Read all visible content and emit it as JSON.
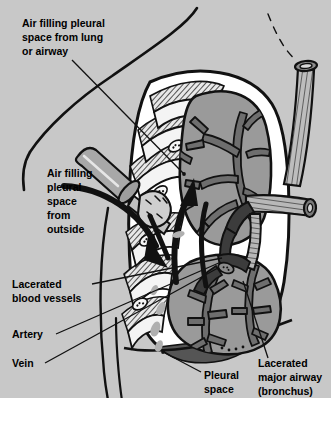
{
  "figure": {
    "background_color": "#ffffff",
    "panel_color": "#c8c8c8",
    "ink_color": "#000000"
  },
  "colors": {
    "body_fill": "#c8c8c8",
    "pleural_air": "#ffffff",
    "lung_fill": "#9a9a9a",
    "lung_dark": "#6e6e6e",
    "airway_fill": "#b4b4b4",
    "blood_dark": "#3c3c3c",
    "rib_fill": "#f2f2f2",
    "muscle_hatch": "#000000",
    "effusion_fill": "#555555",
    "knife_metal": "#a8a8a8"
  },
  "labels": [
    {
      "id": "air-from-lung",
      "name": "label-air-filling-from-lung",
      "lines": [
        "Air filling pleural",
        "space from lung",
        "or airway"
      ],
      "x": 22,
      "y": 27,
      "anchor": "start",
      "leader": {
        "x1": 72,
        "y1": 60,
        "x2": 184,
        "y2": 174
      }
    },
    {
      "id": "air-from-outside",
      "name": "label-air-filling-from-outside",
      "lines": [
        "Air filling",
        "pleural",
        "space",
        "from",
        "outside"
      ],
      "x": 47,
      "y": 177,
      "anchor": "start",
      "leader": null
    },
    {
      "id": "lacerated-vessels",
      "name": "label-lacerated-blood-vessels",
      "lines": [
        "Lacerated",
        "blood vessels"
      ],
      "x": 12,
      "y": 288,
      "anchor": "start",
      "leader": {
        "x1": 92,
        "y1": 284,
        "x2": 222,
        "y2": 258
      }
    },
    {
      "id": "artery",
      "name": "label-artery",
      "lines": [
        "Artery"
      ],
      "x": 12,
      "y": 338,
      "anchor": "start",
      "leader": {
        "x1": 56,
        "y1": 334,
        "x2": 221,
        "y2": 262
      }
    },
    {
      "id": "vein",
      "name": "label-vein",
      "lines": [
        "Vein"
      ],
      "x": 12,
      "y": 367,
      "anchor": "start",
      "leader": {
        "x1": 45,
        "y1": 363,
        "x2": 218,
        "y2": 268
      }
    },
    {
      "id": "pleural-space",
      "name": "label-pleural-space",
      "lines": [
        "Pleural",
        "space"
      ],
      "x": 204,
      "y": 379,
      "anchor": "start",
      "leader": {
        "x1": 201,
        "y1": 372,
        "x2": 163,
        "y2": 352
      }
    },
    {
      "id": "lacerated-airway",
      "name": "label-lacerated-major-airway",
      "lines": [
        "Lacerated",
        "major airway",
        "(bronchus)"
      ],
      "x": 258,
      "y": 367,
      "anchor": "start",
      "leader": {
        "x1": 268,
        "y1": 358,
        "x2": 243,
        "y2": 281
      }
    }
  ],
  "annotations": {
    "arrow_up_name": "air-flow-arrow-upward",
    "arrow_down_name": "air-flow-arrow-downward",
    "arrow_curve_name": "air-flow-arrow-through-wound"
  },
  "anatomy": {
    "structures": [
      "chest-wall",
      "ribs",
      "intercostal-muscles",
      "upper-lung-lobe",
      "lower-lung-lobe",
      "bronchial-tree",
      "trachea",
      "main-bronchus",
      "pulmonary-artery",
      "pulmonary-vein",
      "pleural-space",
      "pleural-effusion",
      "diaphragm",
      "penetrating-knife"
    ]
  }
}
